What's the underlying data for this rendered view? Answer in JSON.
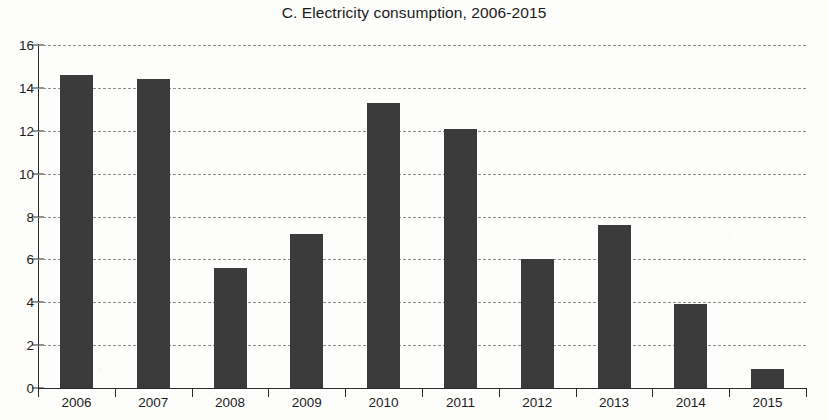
{
  "chart_data": {
    "type": "bar",
    "title": "C. Electricity consumption, 2006-2015",
    "xlabel": "",
    "ylabel": "",
    "categories": [
      "2006",
      "2007",
      "2008",
      "2009",
      "2010",
      "2011",
      "2012",
      "2013",
      "2014",
      "2015"
    ],
    "values": [
      14.6,
      14.4,
      5.6,
      7.2,
      13.3,
      12.1,
      6.0,
      7.6,
      3.9,
      0.9
    ],
    "series": [
      {
        "name": "Electricity consumption",
        "values": [
          14.6,
          14.4,
          5.6,
          7.2,
          13.3,
          12.1,
          6.0,
          7.6,
          3.9,
          0.9
        ]
      }
    ],
    "ylim": [
      0,
      16
    ],
    "ytick_labels": [
      "0",
      "2",
      "4",
      "6",
      "8",
      "10",
      "12",
      "14",
      "16"
    ],
    "ytick_values": [
      0,
      2,
      4,
      6,
      8,
      10,
      12,
      14,
      16
    ],
    "grid": true,
    "grid_style": "dashed-horizontal",
    "legend": false,
    "legend_position": "none",
    "bar_color": "#3b3b3b",
    "axis_color": "#2a2a2a",
    "grid_color": "#8e8e8e",
    "background_color": "#fdfdfc",
    "text_color": "#1d1d1d"
  }
}
